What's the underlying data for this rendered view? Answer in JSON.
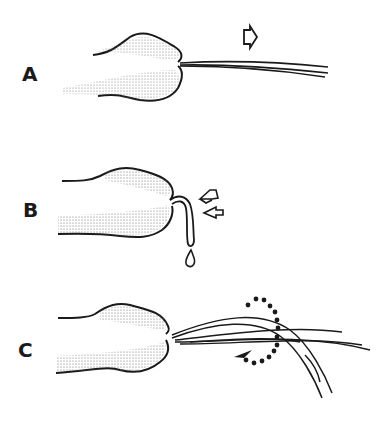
{
  "panels": [
    {
      "id": "A",
      "label": "A",
      "description": "nozzle extruding straight fiber strands, arrow pointing right"
    },
    {
      "id": "B",
      "label": "B",
      "description": "nozzle with fiber bending down and forming drip, two arrows"
    },
    {
      "id": "C",
      "label": "C",
      "description": "nozzle with crossing, twisting fiber strands and dotted circular rotation arrow"
    }
  ],
  "colors": {
    "ink": "#1a1a1a",
    "stipple": "#8a8a8a",
    "background": "#ffffff"
  }
}
